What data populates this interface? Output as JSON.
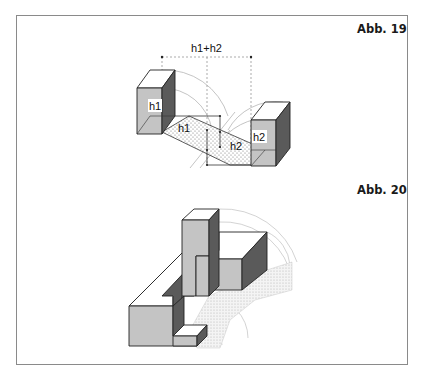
{
  "figures": [
    {
      "label": "Abb. 19",
      "dimension_label": "h1+h2",
      "labels": [
        "h1",
        "h1",
        "h2",
        "h2"
      ]
    },
    {
      "label": "Abb. 20"
    }
  ],
  "colors": {
    "frame": "#8a8a8a",
    "face_light": "#c4c4c4",
    "face_dark": "#5a5a5a",
    "face_top": "#ffffff",
    "construction": "#b0b0b0",
    "outline": "#222222"
  }
}
